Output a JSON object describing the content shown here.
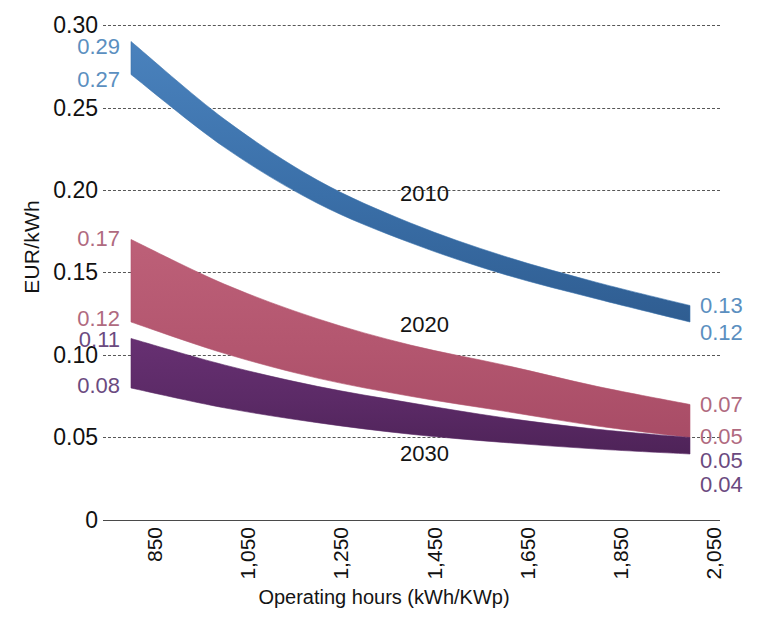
{
  "chart_data": {
    "type": "area",
    "title": "",
    "xlabel": "Operating hours (kWh/KWp)",
    "ylabel": "EUR/kWh",
    "x": [
      850,
      1050,
      1250,
      1450,
      1650,
      1850,
      2050
    ],
    "xticklabels": [
      "850",
      "1,050",
      "1,250",
      "1,450",
      "1,650",
      "1,850",
      "2,050"
    ],
    "yticklabels": [
      "0.30",
      "0.25",
      "0.20",
      "0.15",
      "0.10",
      "0.05",
      "0"
    ],
    "ytickvalues": [
      0.3,
      0.25,
      0.2,
      0.15,
      0.1,
      0.05,
      0
    ],
    "xlim": [
      850,
      2050
    ],
    "ylim": [
      0,
      0.3
    ],
    "grid": true,
    "legend_position": "inline-annotation",
    "series": [
      {
        "name": "2010",
        "color": "#3d74ad",
        "label_color": "#5b8fc0",
        "start_upper": 0.29,
        "start_lower": 0.27,
        "end_upper": 0.13,
        "end_lower": 0.12,
        "upper": [
          0.29,
          0.243,
          0.206,
          0.18,
          0.16,
          0.144,
          0.13
        ],
        "lower": [
          0.27,
          0.226,
          0.192,
          0.168,
          0.149,
          0.134,
          0.12
        ]
      },
      {
        "name": "2020",
        "color": "#b3566f",
        "label_color": "#b06a80",
        "start_upper": 0.17,
        "start_lower": 0.12,
        "end_upper": 0.07,
        "end_lower": 0.05,
        "upper": [
          0.17,
          0.143,
          0.122,
          0.106,
          0.094,
          0.081,
          0.07
        ],
        "lower": [
          0.12,
          0.101,
          0.086,
          0.075,
          0.066,
          0.057,
          0.05
        ]
      },
      {
        "name": "2030",
        "color": "#5b2a66",
        "label_color": "#6b4a80",
        "start_upper": 0.11,
        "start_lower": 0.08,
        "end_upper": 0.05,
        "end_lower": 0.04,
        "upper": [
          0.11,
          0.094,
          0.081,
          0.071,
          0.062,
          0.055,
          0.05
        ],
        "lower": [
          0.08,
          0.068,
          0.059,
          0.052,
          0.047,
          0.043,
          0.04
        ]
      }
    ],
    "left_value_labels": [
      {
        "text": "0.29",
        "series": "2010"
      },
      {
        "text": "0.27",
        "series": "2010"
      },
      {
        "text": "0.17",
        "series": "2020"
      },
      {
        "text": "0.12",
        "series": "2020"
      },
      {
        "text": "0.11",
        "series": "2030"
      },
      {
        "text": "0.08",
        "series": "2030"
      }
    ],
    "right_value_labels": [
      {
        "text": "0.13",
        "series": "2010"
      },
      {
        "text": "0.12",
        "series": "2010"
      },
      {
        "text": "0.07",
        "series": "2020"
      },
      {
        "text": "0.05",
        "series": "2020"
      },
      {
        "text": "0.05",
        "series": "2030"
      },
      {
        "text": "0.04",
        "series": "2030"
      }
    ]
  },
  "axes": {
    "ylabel": "EUR/kWh",
    "xlabel": "Operating hours (kWh/KWp)",
    "yticks": [
      "0.30",
      "0.25",
      "0.20",
      "0.15",
      "0.10",
      "0.05",
      "0"
    ],
    "xticks": [
      "850",
      "1,050",
      "1,250",
      "1,450",
      "1,650",
      "1,850",
      "2,050"
    ]
  },
  "annotations": {
    "s2010": "2010",
    "s2020": "2020",
    "s2030": "2030"
  },
  "values": {
    "l_029": "0.29",
    "l_027": "0.27",
    "l_017": "0.17",
    "l_012": "0.12",
    "l_011": "0.11",
    "l_008": "0.08",
    "r_013": "0.13",
    "r_012": "0.12",
    "r_007": "0.07",
    "r_005a": "0.05",
    "r_005b": "0.05",
    "r_004": "0.04"
  },
  "colors": {
    "band_2010": "#3d74ad",
    "band_2020": "#b3566f",
    "band_2030": "#5b2a66",
    "grid": "#3a3a3a",
    "text": "#141414"
  }
}
